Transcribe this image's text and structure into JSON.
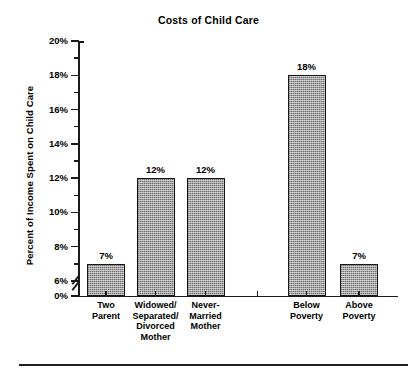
{
  "chart_data": {
    "type": "bar",
    "title": "Costs of Child Care",
    "xlabel": "",
    "ylabel": "Percent of Income Spent on Child Care",
    "ylim": [
      0,
      20
    ],
    "y_axis_break": true,
    "y_break_between": [
      0,
      6
    ],
    "grid": false,
    "legend": "none",
    "y_ticks": [
      "0%",
      "6%",
      "8%",
      "10%",
      "12%",
      "14%",
      "16%",
      "18%",
      "20%"
    ],
    "y_tick_values": [
      0,
      6,
      8,
      10,
      12,
      14,
      16,
      18,
      20
    ],
    "minor_ticks": [
      7,
      9,
      11,
      13,
      15,
      17,
      19
    ],
    "categories": [
      "Two Parent",
      "Widowed/ Separated/ Divorced Mother",
      "Never- Married Mother",
      "Below Poverty",
      "Above Poverty"
    ],
    "values": [
      7,
      12,
      12,
      18,
      7
    ],
    "data_labels": [
      "7%",
      "12%",
      "12%",
      "18%",
      "7%"
    ],
    "groups": [
      {
        "name": "family-structure",
        "categories": [
          "Two Parent",
          "Widowed/ Separated/ Divorced Mother",
          "Never- Married Mother"
        ]
      },
      {
        "name": "poverty-status",
        "categories": [
          "Below Poverty",
          "Above Poverty"
        ]
      }
    ],
    "bar_fill_color": "#8d8d8d",
    "bar_border_color": "#151515"
  },
  "axis": {
    "ticks": [
      {
        "label": "20%",
        "value": 20
      },
      {
        "label": "18%",
        "value": 18
      },
      {
        "label": "16%",
        "value": 16
      },
      {
        "label": "14%",
        "value": 14
      },
      {
        "label": "12%",
        "value": 12
      },
      {
        "label": "10%",
        "value": 10
      },
      {
        "label": "8%",
        "value": 8
      },
      {
        "label": "6%",
        "value": 6
      },
      {
        "label": "0%",
        "value": 0
      }
    ]
  },
  "x_labels": [
    {
      "lines": [
        "Two",
        "Parent"
      ]
    },
    {
      "lines": [
        "Widowed/",
        "Separated/",
        "Divorced",
        "Mother"
      ]
    },
    {
      "lines": [
        "Never-",
        "Married",
        "Mother"
      ]
    },
    {
      "lines": [
        "Below",
        "Poverty"
      ]
    },
    {
      "lines": [
        "Above",
        "Poverty"
      ]
    }
  ]
}
